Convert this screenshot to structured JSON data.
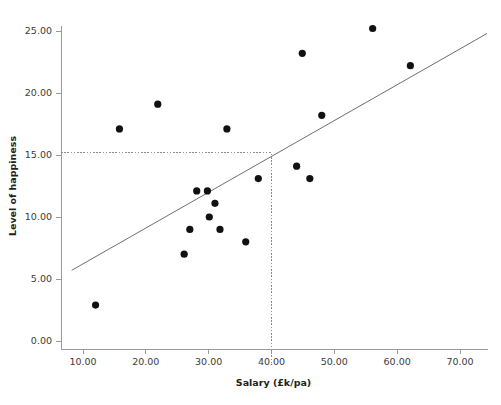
{
  "figure": {
    "width": 501,
    "height": 405,
    "background": "#ffffff",
    "ink_color": "#231f20",
    "point_color": "#111111",
    "line_color": "#6e6e6e",
    "axis_color": "#9a9a9a",
    "reference_line_color": "#8c8c8c"
  },
  "chart_data": {
    "type": "scatter",
    "title": "",
    "xlabel": "Salary (£k/pa)",
    "ylabel": "Level of happiness",
    "xlim": [
      6.5,
      74.5
    ],
    "ylim": [
      -2.0,
      26.5
    ],
    "xticks": [
      10,
      20,
      30,
      40,
      50,
      60,
      70
    ],
    "xtick_labels": [
      "10.00",
      "20.00",
      "30.00",
      "40.00",
      "50.00",
      "60.00",
      "70.00"
    ],
    "yticks": [
      0,
      5,
      10,
      15,
      20,
      25
    ],
    "ytick_labels": [
      "0.00",
      "5.00",
      "10.00",
      "15.00",
      "20.00",
      "25.00"
    ],
    "grid": false,
    "legend": false,
    "series": [
      {
        "name": "observations",
        "marker": "filled-circle",
        "color": "#111111",
        "points": [
          {
            "x": 12.0,
            "y": 2.9
          },
          {
            "x": 15.8,
            "y": 17.1
          },
          {
            "x": 21.9,
            "y": 19.1
          },
          {
            "x": 26.1,
            "y": 7.0
          },
          {
            "x": 27.0,
            "y": 9.0
          },
          {
            "x": 28.1,
            "y": 12.1
          },
          {
            "x": 29.8,
            "y": 12.1
          },
          {
            "x": 30.1,
            "y": 10.0
          },
          {
            "x": 31.0,
            "y": 11.1
          },
          {
            "x": 31.8,
            "y": 9.0
          },
          {
            "x": 32.9,
            "y": 17.1
          },
          {
            "x": 35.9,
            "y": 8.0
          },
          {
            "x": 37.9,
            "y": 13.1
          },
          {
            "x": 44.0,
            "y": 14.1
          },
          {
            "x": 44.9,
            "y": 23.2
          },
          {
            "x": 46.1,
            "y": 13.1
          },
          {
            "x": 48.0,
            "y": 18.2
          },
          {
            "x": 56.1,
            "y": 25.2
          },
          {
            "x": 62.1,
            "y": 22.2
          }
        ]
      }
    ],
    "fit_line": {
      "name": "regression-line",
      "x_start": 8.2,
      "y_start": 5.7,
      "x_end": 74.3,
      "y_end": 24.8,
      "slope": 0.289,
      "intercept": 3.33
    },
    "reference_lines": [
      {
        "name": "horizontal-reference-at-15",
        "orientation": "horizontal",
        "value": 15.2,
        "x_from": 6.5,
        "x_to": 40.0,
        "style": "dashed"
      },
      {
        "name": "vertical-reference-at-40",
        "orientation": "vertical",
        "value": 40.0,
        "y_from": -1.8,
        "y_to": 15.2,
        "style": "dashed"
      }
    ],
    "annotations": []
  }
}
